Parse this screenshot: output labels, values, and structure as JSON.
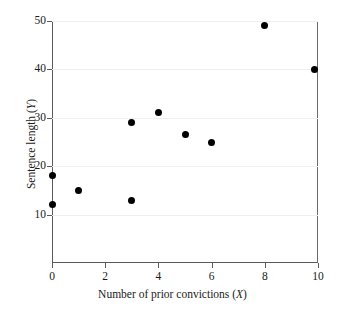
{
  "chart_data": {
    "type": "scatter",
    "title": "",
    "xlabel": "Number of prior convictions (X)",
    "xlabel_text": "Number of prior convictions (",
    "xlabel_var": "X",
    "xlabel_close": ")",
    "ylabel": "Sentence length (Y)",
    "ylabel_text": "Sentence length (",
    "ylabel_var": "Y",
    "ylabel_close": ")",
    "xlim": [
      0,
      10
    ],
    "ylim": [
      0,
      50
    ],
    "xticks": [
      0,
      2,
      4,
      6,
      8,
      10
    ],
    "xtick_labels": [
      "0",
      "2",
      "4",
      "6",
      "8",
      "10"
    ],
    "yticks": [
      10,
      20,
      30,
      40,
      50
    ],
    "ytick_labels": [
      "10",
      "20",
      "30",
      "40",
      "50"
    ],
    "grid": true,
    "grid_axis": "y",
    "legend": null,
    "marker": "filled-circle",
    "marker_color": "#000000",
    "points": [
      {
        "x": 0,
        "y": 18
      },
      {
        "x": 0,
        "y": 12
      },
      {
        "x": 1,
        "y": 15
      },
      {
        "x": 3,
        "y": 29
      },
      {
        "x": 3,
        "y": 13
      },
      {
        "x": 4,
        "y": 31
      },
      {
        "x": 5,
        "y": 26.5
      },
      {
        "x": 6,
        "y": 25
      },
      {
        "x": 8,
        "y": 49
      },
      {
        "x": 9.85,
        "y": 40
      }
    ]
  },
  "colors": {
    "axis": "#5a5a5a",
    "grid": "#efefef",
    "marker": "#000000",
    "text": "#1a1a1a",
    "background": "#ffffff"
  }
}
